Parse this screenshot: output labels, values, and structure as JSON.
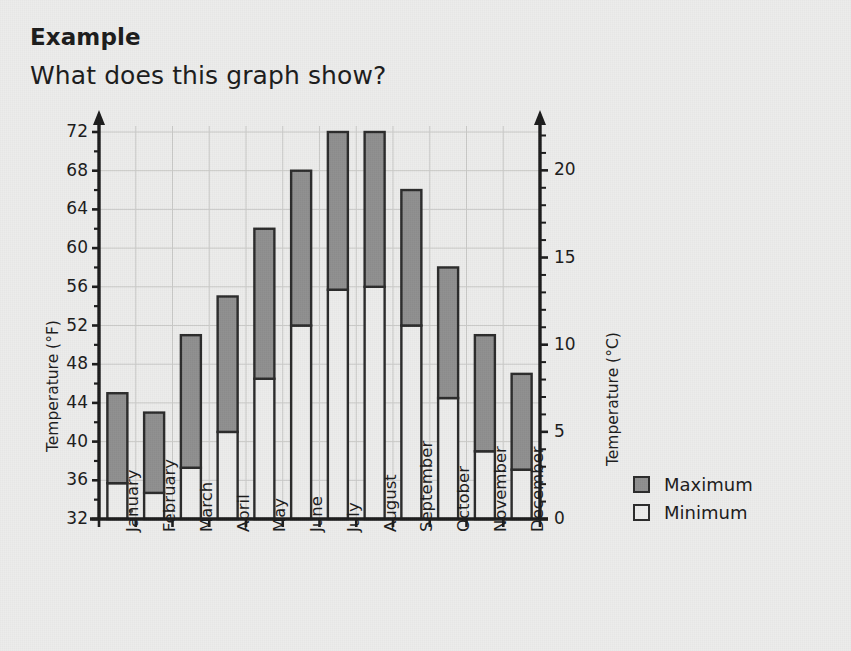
{
  "header": {
    "title": "Example",
    "question": "What does this graph show?"
  },
  "legend": {
    "items": [
      {
        "label": "Maximum",
        "swatch": "filled",
        "color": "#8f8f8f"
      },
      {
        "label": "Minimum",
        "swatch": "empty",
        "color": "#ededec"
      }
    ]
  },
  "colors": {
    "maximum_fill": "#8f8f8f",
    "minimum_fill": "#ececeb",
    "outline": "#2a2a2a",
    "gridline": "#c9c9c7",
    "axis": "#1b1b1b",
    "background": "#ececeb"
  },
  "chart_data": {
    "type": "bar",
    "title": "",
    "subtitle": "",
    "xlabel": "",
    "ylabel": "Temperature (°F)",
    "ylabel_right": "Temperature (°C)",
    "grid": true,
    "legend_position": "right",
    "categories": [
      "January",
      "February",
      "March",
      "April",
      "May",
      "June",
      "July",
      "August",
      "September",
      "October",
      "November",
      "December"
    ],
    "ylim": [
      32,
      72
    ],
    "yticks": [
      32,
      36,
      40,
      44,
      48,
      52,
      56,
      60,
      64,
      68,
      72
    ],
    "ylim_right": [
      0,
      22.2
    ],
    "yticks_right": [
      0,
      5,
      10,
      15,
      20
    ],
    "series": [
      {
        "name": "Maximum",
        "values": [
          45,
          43,
          51,
          55,
          62,
          68,
          72,
          72,
          66,
          58,
          51,
          47
        ]
      },
      {
        "name": "Minimum",
        "values": [
          35.7,
          34.7,
          37.3,
          41,
          46.5,
          52,
          55.7,
          56,
          52,
          44.5,
          39,
          37.1
        ]
      }
    ]
  }
}
